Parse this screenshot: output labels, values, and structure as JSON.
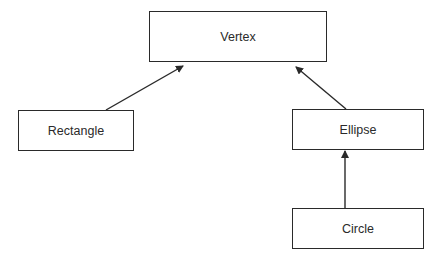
{
  "diagram": {
    "type": "class-hierarchy",
    "nodes": [
      {
        "id": "vertex",
        "label": "Vertex"
      },
      {
        "id": "rectangle",
        "label": "Rectangle"
      },
      {
        "id": "ellipse",
        "label": "Ellipse"
      },
      {
        "id": "circle",
        "label": "Circle"
      }
    ],
    "edges": [
      {
        "from": "rectangle",
        "to": "vertex"
      },
      {
        "from": "ellipse",
        "to": "vertex"
      },
      {
        "from": "circle",
        "to": "ellipse"
      }
    ],
    "colors": {
      "stroke": "#2a2a2a",
      "background": "#ffffff"
    }
  }
}
